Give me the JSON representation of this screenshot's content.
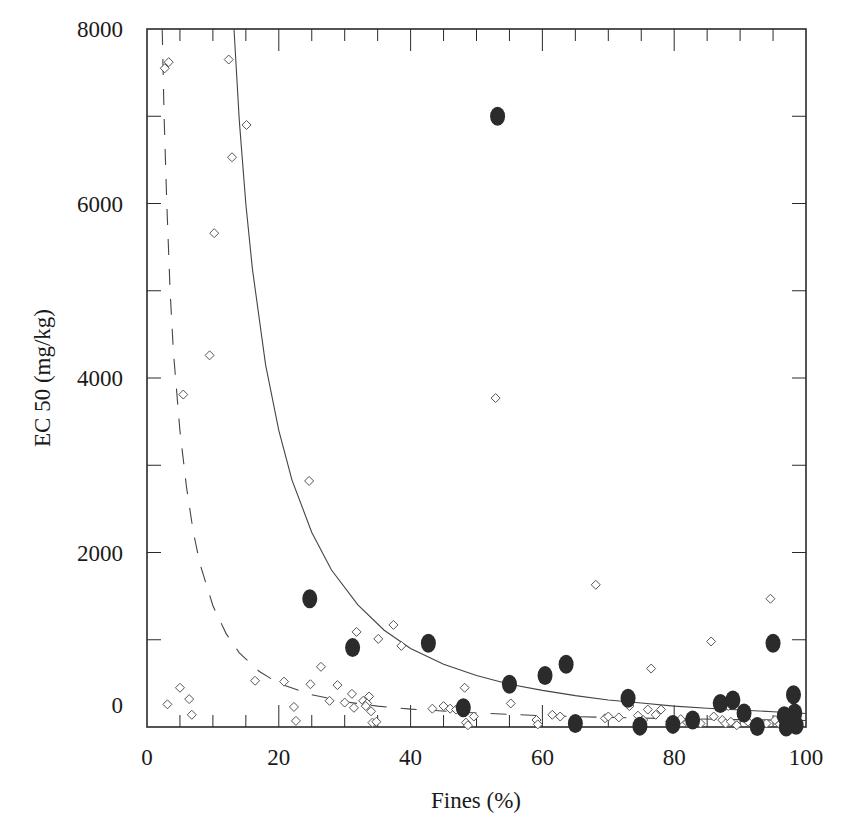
{
  "chart_data": {
    "type": "scatter",
    "title": "",
    "xlabel": "Fines (%)",
    "ylabel": "EC 50 (mg/kg)",
    "xlim": [
      0,
      100
    ],
    "ylim": [
      0,
      8000
    ],
    "x_ticks": [
      0,
      20,
      40,
      60,
      80,
      100
    ],
    "y_ticks": [
      0,
      2000,
      4000,
      6000,
      8000
    ],
    "x_tick_labels": [
      "0",
      "20",
      "40",
      "60",
      "80",
      "100"
    ],
    "y_tick_labels": [
      "0",
      "2000",
      "4000",
      "6000",
      "8000"
    ],
    "grid": false,
    "legend": null,
    "series": [
      {
        "name": "open-diamonds",
        "marker": "diamond-open",
        "points": [
          [
            2.7,
            7550
          ],
          [
            3.3,
            7620
          ],
          [
            12.4,
            7650
          ],
          [
            15.1,
            6900
          ],
          [
            12.9,
            6530
          ],
          [
            10.2,
            5660
          ],
          [
            9.5,
            4260
          ],
          [
            5.5,
            3810
          ],
          [
            3.1,
            260
          ],
          [
            5.0,
            450
          ],
          [
            6.4,
            320
          ],
          [
            6.8,
            140
          ],
          [
            16.4,
            530
          ],
          [
            20.8,
            520
          ],
          [
            22.3,
            230
          ],
          [
            22.6,
            70
          ],
          [
            24.8,
            490
          ],
          [
            24.6,
            2820
          ],
          [
            26.4,
            690
          ],
          [
            28.9,
            480
          ],
          [
            27.7,
            300
          ],
          [
            30.0,
            280
          ],
          [
            31.8,
            1090
          ],
          [
            31.1,
            380
          ],
          [
            31.4,
            220
          ],
          [
            32.8,
            300
          ],
          [
            33.4,
            270
          ],
          [
            33.7,
            350
          ],
          [
            34.0,
            180
          ],
          [
            33.2,
            240
          ],
          [
            34.2,
            50
          ],
          [
            34.8,
            60
          ],
          [
            35.1,
            1010
          ],
          [
            37.4,
            1170
          ],
          [
            38.6,
            930
          ],
          [
            43.3,
            210
          ],
          [
            45.0,
            240
          ],
          [
            46.0,
            210
          ],
          [
            46.9,
            200
          ],
          [
            47.5,
            230
          ],
          [
            47.9,
            260
          ],
          [
            48.2,
            450
          ],
          [
            48.4,
            50
          ],
          [
            48.7,
            20
          ],
          [
            49.6,
            120
          ],
          [
            52.9,
            3770
          ],
          [
            55.2,
            270
          ],
          [
            59.1,
            80
          ],
          [
            59.3,
            30
          ],
          [
            61.5,
            140
          ],
          [
            62.7,
            120
          ],
          [
            68.1,
            1630
          ],
          [
            69.5,
            100
          ],
          [
            70.0,
            120
          ],
          [
            71.6,
            110
          ],
          [
            73.2,
            240
          ],
          [
            74.5,
            130
          ],
          [
            75.3,
            80
          ],
          [
            76.0,
            200
          ],
          [
            76.5,
            670
          ],
          [
            77.2,
            140
          ],
          [
            78.0,
            200
          ],
          [
            79.4,
            60
          ],
          [
            81.0,
            90
          ],
          [
            82.0,
            50
          ],
          [
            84.0,
            40
          ],
          [
            85.6,
            980
          ],
          [
            86.0,
            120
          ],
          [
            86.6,
            280
          ],
          [
            87.3,
            80
          ],
          [
            87.8,
            40
          ],
          [
            88.2,
            240
          ],
          [
            88.6,
            60
          ],
          [
            89.5,
            20
          ],
          [
            91.2,
            60
          ],
          [
            92.6,
            60
          ],
          [
            94.0,
            40
          ],
          [
            94.6,
            1470
          ],
          [
            95.3,
            80
          ],
          [
            96.0,
            30
          ],
          [
            96.5,
            120
          ],
          [
            97.2,
            60
          ]
        ]
      },
      {
        "name": "filled-circles",
        "marker": "circle-filled",
        "points": [
          [
            53.2,
            7000
          ],
          [
            24.7,
            1470
          ],
          [
            31.2,
            910
          ],
          [
            42.7,
            960
          ],
          [
            55.0,
            490
          ],
          [
            60.4,
            590
          ],
          [
            63.6,
            720
          ],
          [
            48.0,
            220
          ],
          [
            65.0,
            40
          ],
          [
            73.0,
            330
          ],
          [
            74.8,
            10
          ],
          [
            79.8,
            30
          ],
          [
            82.8,
            80
          ],
          [
            87.0,
            270
          ],
          [
            88.9,
            310
          ],
          [
            90.6,
            160
          ],
          [
            92.6,
            5
          ],
          [
            95.0,
            960
          ],
          [
            96.7,
            130
          ],
          [
            97.3,
            40
          ],
          [
            98.1,
            370
          ],
          [
            98.3,
            160
          ],
          [
            98.5,
            20
          ],
          [
            97.0,
            0
          ]
        ]
      }
    ],
    "fits": [
      {
        "name": "solid-fit-curve",
        "style": "solid",
        "points": [
          [
            13.2,
            8000
          ],
          [
            14,
            6950
          ],
          [
            15,
            6000
          ],
          [
            16,
            5250
          ],
          [
            18,
            4150
          ],
          [
            20,
            3400
          ],
          [
            22,
            2830
          ],
          [
            25,
            2230
          ],
          [
            28,
            1800
          ],
          [
            32,
            1400
          ],
          [
            36,
            1110
          ],
          [
            40,
            900
          ],
          [
            45,
            720
          ],
          [
            50,
            590
          ],
          [
            55,
            490
          ],
          [
            60,
            420
          ],
          [
            65,
            360
          ],
          [
            70,
            310
          ],
          [
            75,
            275
          ],
          [
            80,
            240
          ],
          [
            85,
            215
          ],
          [
            90,
            195
          ],
          [
            95,
            175
          ],
          [
            100,
            155
          ]
        ]
      },
      {
        "name": "dashed-fit-curve",
        "style": "dashed",
        "points": [
          [
            2.3,
            8000
          ],
          [
            2.6,
            7000
          ],
          [
            3.0,
            6000
          ],
          [
            3.5,
            5000
          ],
          [
            4.0,
            4300
          ],
          [
            5.0,
            3400
          ],
          [
            6.0,
            2750
          ],
          [
            7.0,
            2250
          ],
          [
            8.0,
            1880
          ],
          [
            10.0,
            1390
          ],
          [
            12.0,
            1070
          ],
          [
            14.0,
            850
          ],
          [
            17.0,
            640
          ],
          [
            20.0,
            500
          ],
          [
            25.0,
            370
          ],
          [
            30.0,
            290
          ],
          [
            35.0,
            240
          ],
          [
            40.0,
            205
          ],
          [
            50.0,
            160
          ],
          [
            60.0,
            130
          ],
          [
            70.0,
            110
          ],
          [
            80.0,
            95
          ],
          [
            90.0,
            85
          ],
          [
            100.0,
            75
          ]
        ]
      }
    ]
  }
}
